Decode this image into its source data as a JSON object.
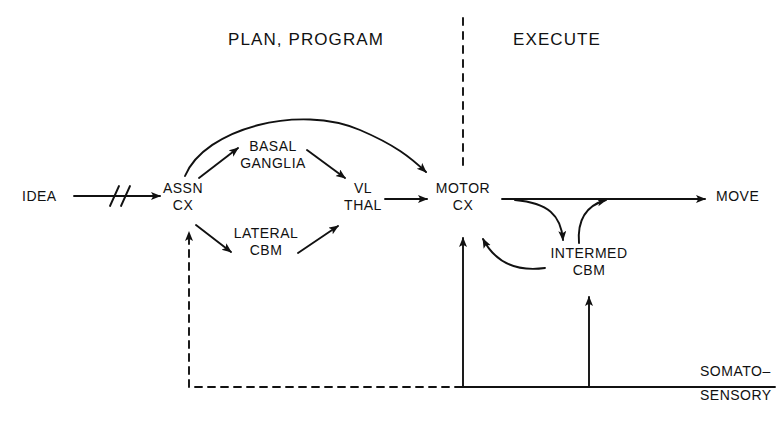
{
  "figure": {
    "kind": "flow-diagram",
    "background_color": "#ffffff",
    "ink_color": "#111111"
  },
  "sections": {
    "left": {
      "title": "PLAN, PROGRAM"
    },
    "right": {
      "title": "EXECUTE"
    }
  },
  "divider": {
    "style": "dashed",
    "orientation": "vertical"
  },
  "nodes": {
    "idea": {
      "label": "IDEA"
    },
    "assn_cx": {
      "line1": "ASSN",
      "line2": "CX"
    },
    "basal_ganglia": {
      "line1": "BASAL",
      "line2": "GANGLIA"
    },
    "lateral_cbm": {
      "line1": "LATERAL",
      "line2": "CBM"
    },
    "vl_thal": {
      "line1": "VL",
      "line2": "THAL"
    },
    "motor_cx": {
      "line1": "MOTOR",
      "line2": "CX"
    },
    "intermed_cbm": {
      "line1": "INTERMED",
      "line2": "CBM"
    },
    "move": {
      "label": "MOVE"
    },
    "somato_sensory": {
      "line1": "SOMATO–",
      "line2": "SENSORY"
    }
  },
  "edges": [
    {
      "from": "idea",
      "to": "assn_cx",
      "style": "solid-with-break",
      "note": "double slash interruption"
    },
    {
      "from": "assn_cx",
      "to": "basal_ganglia",
      "style": "solid"
    },
    {
      "from": "basal_ganglia",
      "to": "vl_thal",
      "style": "solid"
    },
    {
      "from": "assn_cx",
      "to": "motor_cx",
      "style": "solid-arc",
      "note": "long arc over basal ganglia"
    },
    {
      "from": "assn_cx",
      "to": "lateral_cbm",
      "style": "solid"
    },
    {
      "from": "lateral_cbm",
      "to": "vl_thal",
      "style": "solid"
    },
    {
      "from": "vl_thal",
      "to": "motor_cx",
      "style": "solid"
    },
    {
      "from": "motor_cx",
      "to": "move",
      "style": "solid"
    },
    {
      "from": "motor_cx",
      "to": "intermed_cbm",
      "style": "solid-curve"
    },
    {
      "from": "intermed_cbm",
      "to": "move",
      "style": "solid-curve"
    },
    {
      "from": "intermed_cbm",
      "to": "motor_cx",
      "style": "solid-curve"
    },
    {
      "from": "somato_sensory",
      "to": "motor_cx",
      "style": "solid"
    },
    {
      "from": "somato_sensory",
      "to": "intermed_cbm",
      "style": "solid"
    },
    {
      "from": "somato_sensory",
      "to": "assn_cx",
      "style": "dashed"
    }
  ]
}
